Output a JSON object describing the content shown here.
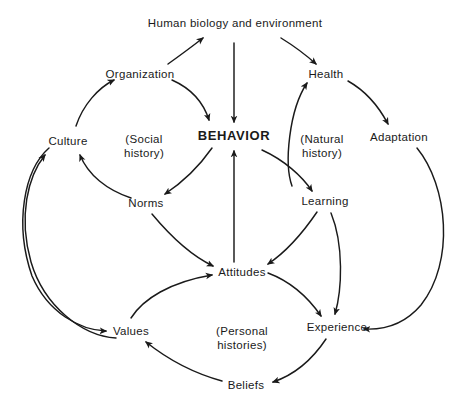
{
  "diagram": {
    "background_color": "#ffffff",
    "stroke_color": "#1a1a1a",
    "text_color": "#1a1a1a",
    "nodes": [
      {
        "id": "human-biology",
        "label": "Human biology and\nenvironment",
        "x": 235,
        "y": 24,
        "emphasis": "normal"
      },
      {
        "id": "organization",
        "label": "Organization",
        "x": 140,
        "y": 74,
        "emphasis": "normal"
      },
      {
        "id": "health",
        "label": "Health",
        "x": 326,
        "y": 74,
        "emphasis": "normal"
      },
      {
        "id": "culture",
        "label": "Culture",
        "x": 68,
        "y": 141,
        "emphasis": "normal"
      },
      {
        "id": "behavior",
        "label": "BEHAVIOR",
        "x": 234,
        "y": 136,
        "emphasis": "bold"
      },
      {
        "id": "adaptation",
        "label": "Adaptation",
        "x": 399,
        "y": 137,
        "emphasis": "normal"
      },
      {
        "id": "norms",
        "label": "Norms",
        "x": 146,
        "y": 203,
        "emphasis": "normal"
      },
      {
        "id": "learning",
        "label": "Learning",
        "x": 325,
        "y": 201,
        "emphasis": "normal"
      },
      {
        "id": "attitudes",
        "label": "Attitudes",
        "x": 242,
        "y": 272,
        "emphasis": "normal"
      },
      {
        "id": "values",
        "label": "Values",
        "x": 131,
        "y": 331,
        "emphasis": "normal"
      },
      {
        "id": "experience",
        "label": "Experience",
        "x": 337,
        "y": 327,
        "emphasis": "normal"
      },
      {
        "id": "beliefs",
        "label": "Beliefs",
        "x": 246,
        "y": 385,
        "emphasis": "normal"
      }
    ],
    "annotations": [
      {
        "id": "social-history",
        "label": "(Social\nhistory)",
        "x": 144,
        "y": 139
      },
      {
        "id": "natural-history",
        "label": "(Natural\nhistory)",
        "x": 322,
        "y": 139
      },
      {
        "id": "personal-histories",
        "label": "(Personal\nhistories)",
        "x": 242,
        "y": 331
      }
    ],
    "edges": [
      {
        "id": "culture-to-organization",
        "from": "culture",
        "to": "organization"
      },
      {
        "id": "organization-to-human-biology",
        "from": "organization",
        "to": "human-biology"
      },
      {
        "id": "organization-to-behavior",
        "from": "organization",
        "to": "behavior"
      },
      {
        "id": "human-biology-to-behavior",
        "from": "human-biology",
        "to": "behavior"
      },
      {
        "id": "human-biology-to-health",
        "from": "human-biology",
        "to": "health"
      },
      {
        "id": "health-to-adaptation",
        "from": "health",
        "to": "adaptation"
      },
      {
        "id": "behavior-to-norms",
        "from": "behavior",
        "to": "norms"
      },
      {
        "id": "behavior-to-learning",
        "from": "behavior",
        "to": "learning"
      },
      {
        "id": "norms-to-culture",
        "from": "norms",
        "to": "culture"
      },
      {
        "id": "norms-to-attitudes",
        "from": "norms",
        "to": "attitudes"
      },
      {
        "id": "learning-to-health",
        "from": "learning",
        "to": "health"
      },
      {
        "id": "learning-to-attitudes",
        "from": "learning",
        "to": "attitudes"
      },
      {
        "id": "learning-to-experience",
        "from": "learning",
        "to": "experience"
      },
      {
        "id": "adaptation-to-experience",
        "from": "adaptation",
        "to": "experience"
      },
      {
        "id": "attitudes-to-behavior",
        "from": "attitudes",
        "to": "behavior"
      },
      {
        "id": "attitudes-to-experience",
        "from": "attitudes",
        "to": "experience"
      },
      {
        "id": "values-to-attitudes",
        "from": "values",
        "to": "attitudes"
      },
      {
        "id": "culture-to-values",
        "from": "culture",
        "to": "values"
      },
      {
        "id": "values-to-culture",
        "from": "values",
        "to": "culture"
      },
      {
        "id": "experience-to-beliefs",
        "from": "experience",
        "to": "beliefs"
      },
      {
        "id": "beliefs-to-values",
        "from": "beliefs",
        "to": "values"
      }
    ]
  }
}
